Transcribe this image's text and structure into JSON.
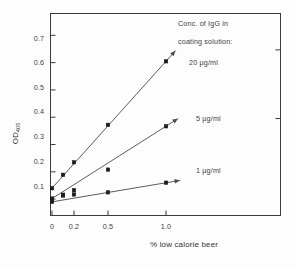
{
  "chart_data": {
    "type": "line",
    "title": "",
    "xlabel": "% low calorie beer",
    "ylabel": "OD",
    "ylabel_subscript": "405",
    "x": [
      0,
      0.1,
      0.2,
      0.5,
      1.0
    ],
    "xtick_labels": [
      "0",
      "0.2",
      "0.5",
      "1.0"
    ],
    "xtick_values": [
      0,
      0.2,
      0.5,
      1.0
    ],
    "ytick_labels": [
      "0.1",
      "0.2",
      "0.3",
      "0.4",
      "0.5",
      "0.6",
      "0.7"
    ],
    "ytick_values": [
      0.1,
      0.2,
      0.3,
      0.4,
      0.5,
      0.6,
      0.7
    ],
    "ylim": [
      0.04,
      0.78
    ],
    "grid": false,
    "legend_position": "inside-right-annotations",
    "annotation_title": [
      "Conc. of IgG in",
      "coating solution:"
    ],
    "series": [
      {
        "name": "20 µg/ml",
        "marker": "square",
        "values": [
          0.14,
          0.189,
          0.235,
          0.372,
          0.605
        ],
        "label": "20  µg/ml"
      },
      {
        "name": "5 µg/ml",
        "marker": "square",
        "values": [
          0.102,
          0.116,
          0.133,
          0.208,
          0.367
        ],
        "label": "5 µg/ml"
      },
      {
        "name": "1 µg/ml",
        "marker": "square",
        "values": [
          0.09,
          0.113,
          0.117,
          0.125,
          0.16
        ],
        "label": "1 µg/ml"
      }
    ]
  },
  "axes": {
    "y_ticks": [
      {
        "label": "0.7"
      },
      {
        "label": "0.6"
      },
      {
        "label": "0.5"
      },
      {
        "label": "0.4"
      },
      {
        "label": "0.3"
      },
      {
        "label": "0.2"
      },
      {
        "label": "0.1"
      }
    ],
    "x_ticks": [
      {
        "label": "0"
      },
      {
        "label": "0.2"
      },
      {
        "label": "0.5"
      },
      {
        "label": "1.0"
      }
    ],
    "y_title": "OD",
    "y_title_sub": "405",
    "x_title": "% low calorie beer"
  },
  "annotations": {
    "note_1": "Conc. of IgG in",
    "note_2": "coating solution:",
    "series_label_20": "20  µg/ml",
    "series_label_5": "5 µg/ml",
    "series_label_1": "1 µg/ml"
  },
  "colors": {
    "axis": "#3a3a3a",
    "line": "#4a4a4a",
    "marker": "#1d1d1d",
    "text": "#3d3d3d",
    "background": "#fdfdfd"
  }
}
